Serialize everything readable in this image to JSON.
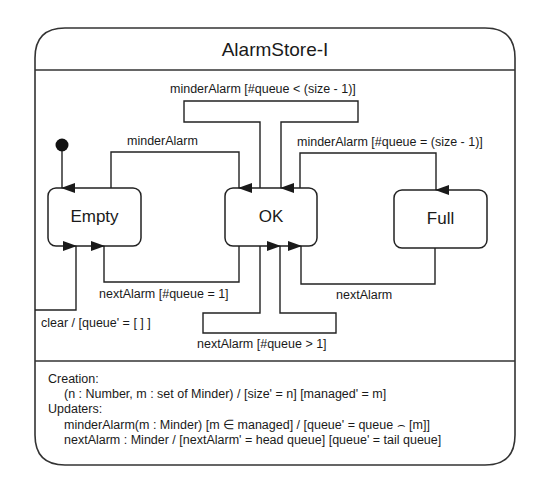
{
  "diagram": {
    "title": "AlarmStore-I",
    "states": [
      {
        "id": "empty",
        "label": "Empty"
      },
      {
        "id": "ok",
        "label": "OK"
      },
      {
        "id": "full",
        "label": "Full"
      }
    ],
    "initial": {
      "target": "Empty"
    },
    "transitions": [
      {
        "from": "Empty",
        "to": "OK",
        "label": "minderAlarm"
      },
      {
        "from": "OK",
        "to": "OK",
        "label": "minderAlarm [#queue < (size - 1)]"
      },
      {
        "from": "OK",
        "to": "Full",
        "label": "minderAlarm [#queue = (size - 1)]"
      },
      {
        "from": "OK",
        "to": "Empty",
        "label": "nextAlarm [#queue = 1]"
      },
      {
        "from": "OK",
        "to": "OK",
        "label": "nextAlarm [#queue > 1]"
      },
      {
        "from": "Full",
        "to": "OK",
        "label": "nextAlarm"
      },
      {
        "from": "any",
        "to": "Empty",
        "label": "clear / [queue' = [ ] ]"
      }
    ],
    "spec": {
      "creation_heading": "Creation:",
      "creation_line": "(n : Number, m : set of Minder) / [size' = n] [managed' = m]",
      "updaters_heading": "Updaters:",
      "updater_1": "minderAlarm(m : Minder) [m ∈ managed] / [queue' = queue ⌢ [m]]",
      "updater_2": "nextAlarm : Minder / [nextAlarm' = head queue] [queue' = tail queue]"
    }
  }
}
